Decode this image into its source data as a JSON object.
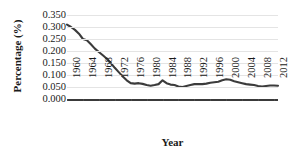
{
  "chart_data": {
    "type": "line",
    "title": "",
    "xlabel": "Year",
    "ylabel": "Percentage (%)",
    "xlim": [
      1960,
      2013
    ],
    "ylim": [
      0.0,
      0.35
    ],
    "grid": true,
    "legend": null,
    "line_color": "#3b3b3b",
    "gridline_color": "#e4e4e4",
    "ytick_labels": [
      "0.350",
      "0.300",
      "0.250",
      "0.200",
      "0.150",
      "0.100",
      "0.050",
      "0.000"
    ],
    "ytick_values": [
      0.35,
      0.3,
      0.25,
      0.2,
      0.15,
      0.1,
      0.05,
      0.0
    ],
    "xtick_labels": [
      "1960",
      "1964",
      "1968",
      "1972",
      "1976",
      "1980",
      "1984",
      "1988",
      "1992",
      "1996",
      "2000",
      "2004",
      "2008",
      "2012"
    ],
    "xtick_values": [
      1960,
      1964,
      1968,
      1972,
      1976,
      1980,
      1984,
      1988,
      1992,
      1996,
      2000,
      2004,
      2008,
      2012
    ],
    "x": [
      1960,
      1961,
      1962,
      1963,
      1964,
      1965,
      1966,
      1967,
      1968,
      1969,
      1970,
      1971,
      1972,
      1973,
      1974,
      1975,
      1976,
      1977,
      1978,
      1979,
      1980,
      1981,
      1982,
      1983,
      1984,
      1985,
      1986,
      1987,
      1988,
      1989,
      1990,
      1991,
      1992,
      1993,
      1994,
      1995,
      1996,
      1997,
      1998,
      1999,
      2000,
      2001,
      2002,
      2003,
      2004,
      2005,
      2006,
      2007,
      2008,
      2009,
      2010,
      2011,
      2012,
      2013
    ],
    "values": [
      0.31,
      0.3,
      0.288,
      0.272,
      0.25,
      0.245,
      0.228,
      0.21,
      0.196,
      0.182,
      0.168,
      0.15,
      0.13,
      0.112,
      0.094,
      0.078,
      0.066,
      0.064,
      0.066,
      0.063,
      0.058,
      0.055,
      0.058,
      0.062,
      0.078,
      0.066,
      0.06,
      0.058,
      0.052,
      0.05,
      0.054,
      0.058,
      0.062,
      0.062,
      0.062,
      0.064,
      0.068,
      0.07,
      0.072,
      0.078,
      0.082,
      0.08,
      0.074,
      0.07,
      0.066,
      0.062,
      0.06,
      0.058,
      0.054,
      0.052,
      0.054,
      0.056,
      0.056,
      0.055
    ]
  }
}
